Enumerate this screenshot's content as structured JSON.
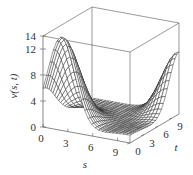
{
  "chart_data": {
    "type": "surface3d",
    "title": "",
    "xlabel": "s",
    "ylabel": "t",
    "zlabel": "v(s, t)",
    "x_ticks": [
      0,
      3,
      6,
      9
    ],
    "y_ticks": [
      0,
      3,
      6,
      9
    ],
    "z_ticks": [
      0,
      4,
      8,
      12,
      14
    ],
    "xlim": [
      0,
      10.5
    ],
    "ylim": [
      0,
      10.5
    ],
    "zlim": [
      0,
      14
    ],
    "grid": false,
    "box": true,
    "surface_description": "Wireframe mesh: tall peak (~14) near s≈2, t≈0 decaying toward middle (~0 near s≈6-9, t≈3-6), secondary rising ridge near s≈10, t≈9-10 (~9)",
    "mesh_resolution": [
      25,
      25
    ],
    "colors": {
      "mesh_line": "#222222",
      "surface_fill": "#ffffff",
      "box": "#555555"
    }
  },
  "labels": {
    "z_axis_label": "v(s, t)",
    "x_axis_label": "s",
    "y_axis_label": "t"
  }
}
